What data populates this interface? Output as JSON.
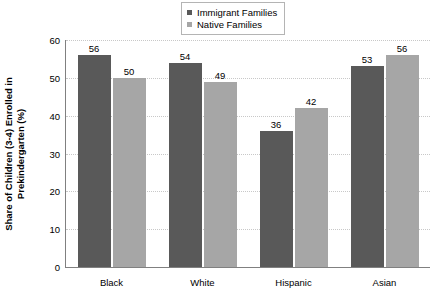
{
  "chart_data": {
    "type": "bar",
    "title": "",
    "xlabel": "",
    "ylabel": "Share of Children (3-4) Enrolled in Prekindergarten (%)",
    "ylabel_lines": [
      "Share of Children (3-4) Enrolled in",
      "Prekindergarten (%)"
    ],
    "categories": [
      "Black",
      "White",
      "Hispanic",
      "Asian"
    ],
    "series": [
      {
        "name": "Immigrant Families",
        "values": [
          56,
          54,
          36,
          53
        ],
        "color": "#595959"
      },
      {
        "name": "Native Families",
        "values": [
          50,
          49,
          42,
          56
        ],
        "color": "#a6a6a6"
      }
    ],
    "ylim": [
      0,
      60
    ],
    "yticks": [
      0,
      10,
      20,
      30,
      40,
      50,
      60
    ],
    "ytick_labels": [
      "0",
      "10",
      "20",
      "30",
      "40",
      "50",
      "60"
    ],
    "grid": true,
    "grid_style": "dotted",
    "grid_color": "#c8c8c8",
    "legend_position": "top-center",
    "axis_color": "#808080",
    "background": "#ffffff",
    "data_labels": true
  },
  "legend": {
    "items": [
      {
        "label": "Immigrant Families",
        "color": "#595959"
      },
      {
        "label": "Native Families",
        "color": "#a6a6a6"
      }
    ]
  }
}
